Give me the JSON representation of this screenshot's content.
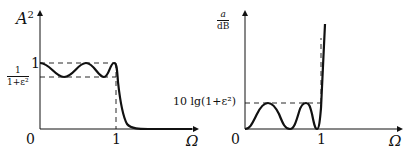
{
  "left_plot": {
    "y_axis_label": "A",
    "y_axis_exp": "2",
    "x_axis_label": "Ω",
    "origin_label": "0",
    "x_tick_1": "1",
    "y_tick_1": "1",
    "y_tick_ripple_num": "1",
    "y_tick_ripple_den": "1+ε²",
    "description": "Chebyshev low-pass squared magnitude response with equiripple passband between 1/(1+ε²) and 1, cutoff at Ω=1"
  },
  "right_plot": {
    "y_axis_num": "a",
    "y_axis_den": "dB",
    "x_axis_label": "Ω",
    "origin_label": "0",
    "x_tick_1": "1",
    "y_tick_ripple": "10 lg(1+ε²)",
    "description": "Attenuation in dB with equiripple passband between 0 and 10 lg(1+ε²), rising steeply after Ω=1"
  }
}
